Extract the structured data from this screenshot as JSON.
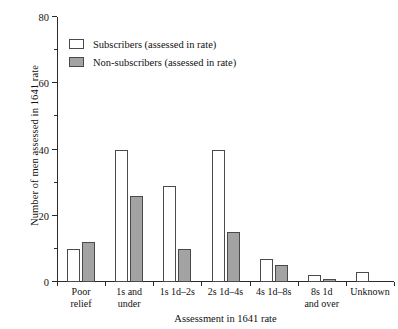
{
  "chart_data": {
    "type": "bar",
    "title": "",
    "xlabel": "Assessment in 1641 rate",
    "ylabel": "Number of men assessed in 1641 rate",
    "ylim": [
      0,
      80
    ],
    "ytick_values": [
      0,
      20,
      40,
      60,
      80
    ],
    "ytick_labels": [
      "0",
      "20",
      "40",
      "60",
      "80"
    ],
    "yminor_values": [
      10,
      30,
      50,
      70
    ],
    "grid": false,
    "legend_position": "upper-left-inside",
    "categories": [
      "Poor\nrelief",
      "1s and\nunder",
      "1s 1d–2s",
      "2s 1d–4s",
      "4s 1d–8s",
      "8s 1d\nand over",
      "Unknown"
    ],
    "category_lines": [
      [
        "Poor",
        "relief"
      ],
      [
        "1s and",
        "under"
      ],
      [
        "1s 1d–2s",
        ""
      ],
      [
        "2s 1d–4s",
        ""
      ],
      [
        "4s 1d–8s",
        ""
      ],
      [
        "8s 1d",
        "and over"
      ],
      [
        "Unknown",
        ""
      ]
    ],
    "series": [
      {
        "name": "Subscribers (assessed in rate)",
        "color": "#ffffff",
        "edge_color": "#4a4a4a",
        "values": [
          10,
          40,
          29,
          40,
          7,
          2,
          3
        ]
      },
      {
        "name": "Non-subscribers (assessed in rate)",
        "color": "#a3a3a3",
        "edge_color": "#4a4a4a",
        "values": [
          12,
          26,
          10,
          15,
          5,
          1,
          0
        ]
      }
    ]
  }
}
